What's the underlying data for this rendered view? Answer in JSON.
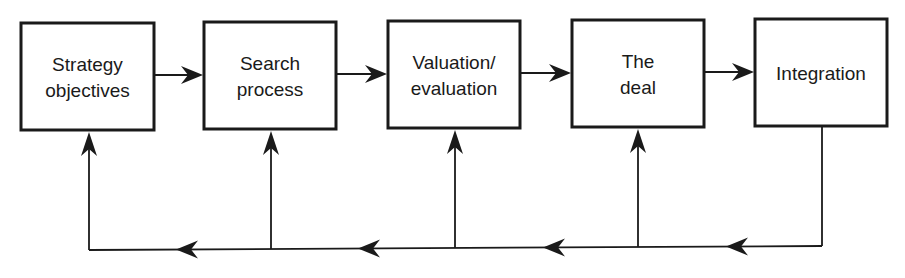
{
  "diagram": {
    "type": "process-flow-with-feedback",
    "colors": {
      "stroke": "#1a1a1a",
      "background": "#ffffff"
    },
    "steps": [
      {
        "id": "strategy",
        "lines": [
          "Strategy",
          "objectives"
        ]
      },
      {
        "id": "search",
        "lines": [
          "Search",
          "process"
        ]
      },
      {
        "id": "valuation",
        "lines": [
          "Valuation/",
          "evaluation"
        ]
      },
      {
        "id": "deal",
        "lines": [
          "The",
          "deal"
        ]
      },
      {
        "id": "integration",
        "lines": [
          "Integration"
        ]
      }
    ],
    "forward_arrows": [
      {
        "from": "strategy",
        "to": "search"
      },
      {
        "from": "search",
        "to": "valuation"
      },
      {
        "from": "valuation",
        "to": "deal"
      },
      {
        "from": "deal",
        "to": "integration"
      }
    ],
    "feedback": {
      "source": "integration",
      "targets": [
        "deal",
        "valuation",
        "search",
        "strategy"
      ]
    }
  }
}
